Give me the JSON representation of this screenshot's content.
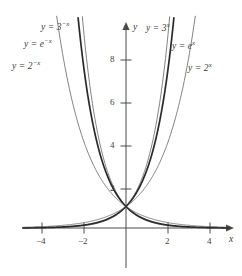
{
  "chart_data": {
    "type": "line",
    "title": "",
    "xlabel": "x",
    "ylabel": "y",
    "xlim": [
      -4.8,
      4.8
    ],
    "ylim": [
      -0.6,
      9.6
    ],
    "grid": false,
    "legend": "inline-curve-labels",
    "x_ticks": [
      -4,
      -2,
      2,
      4
    ],
    "x_tick_labels": [
      "-4",
      "-2",
      "2",
      "4"
    ],
    "y_ticks": [
      2,
      4,
      6,
      8
    ],
    "y_tick_labels": [
      "2",
      "4",
      "6",
      "8"
    ],
    "series": [
      {
        "name": "y = 3^-x",
        "base": 3,
        "sign": -1,
        "emphasis": "thin",
        "color": "#555555"
      },
      {
        "name": "y = e^-x",
        "base": 2.718281828,
        "sign": -1,
        "emphasis": "thick",
        "color": "#2a2a2a"
      },
      {
        "name": "y = 2^-x",
        "base": 2,
        "sign": -1,
        "emphasis": "thin",
        "color": "#555555"
      },
      {
        "name": "y = 3^x",
        "base": 3,
        "sign": 1,
        "emphasis": "thin",
        "color": "#555555"
      },
      {
        "name": "y = e^x",
        "base": 2.718281828,
        "sign": 1,
        "emphasis": "thick",
        "color": "#2a2a2a"
      },
      {
        "name": "y = 2^x",
        "base": 2,
        "sign": 1,
        "emphasis": "thin",
        "color": "#555555"
      }
    ],
    "annotations": [
      {
        "id": "label-3-neg-x",
        "base": "3",
        "exponent": "-x",
        "text": "y = 3",
        "sup": "−x"
      },
      {
        "id": "label-e-neg-x",
        "base": "e",
        "exponent": "-x",
        "text": "y = e",
        "sup": "−x"
      },
      {
        "id": "label-2-neg-x",
        "base": "2",
        "exponent": "-x",
        "text": "y = 2",
        "sup": "−x"
      },
      {
        "id": "label-3-x",
        "base": "3",
        "exponent": "x",
        "text": "y = 3",
        "sup": "x"
      },
      {
        "id": "label-e-x",
        "base": "e",
        "exponent": "x",
        "text": "y = e",
        "sup": "x"
      },
      {
        "id": "label-2-x",
        "base": "2",
        "exponent": "x",
        "text": "y = 2",
        "sup": "x"
      }
    ],
    "note": "Six exponential curves y = b^(±x) for b = 2, e, 3 all passing through (0, 1); the e-based curves are drawn with a heavier stroke."
  },
  "labels": {
    "three_neg_x": {
      "lead": "y = 3",
      "exp": "−x"
    },
    "e_neg_x": {
      "lead": "y = e",
      "exp": "−x"
    },
    "two_neg_x": {
      "lead": "y = 2",
      "exp": "−x"
    },
    "three_x": {
      "lead": "y = 3",
      "exp": "x"
    },
    "e_x": {
      "lead": "y = e",
      "exp": "x"
    },
    "two_x": {
      "lead": "y = 2",
      "exp": "x"
    }
  },
  "axes": {
    "x_axis_name": "x",
    "y_axis_name": "y",
    "x_tick_labels": {
      "neg4": "−4",
      "neg2": "−2",
      "pos2": "2",
      "pos4": "4"
    },
    "y_tick_labels": {
      "two": "2",
      "four": "4",
      "six": "6",
      "eight": "8"
    }
  },
  "colors": {
    "axis": "#4a4a4a",
    "curve_thin": "#555555",
    "curve_thick": "#2a2a2a",
    "text": "#3a3a3a",
    "background": "#ffffff"
  }
}
